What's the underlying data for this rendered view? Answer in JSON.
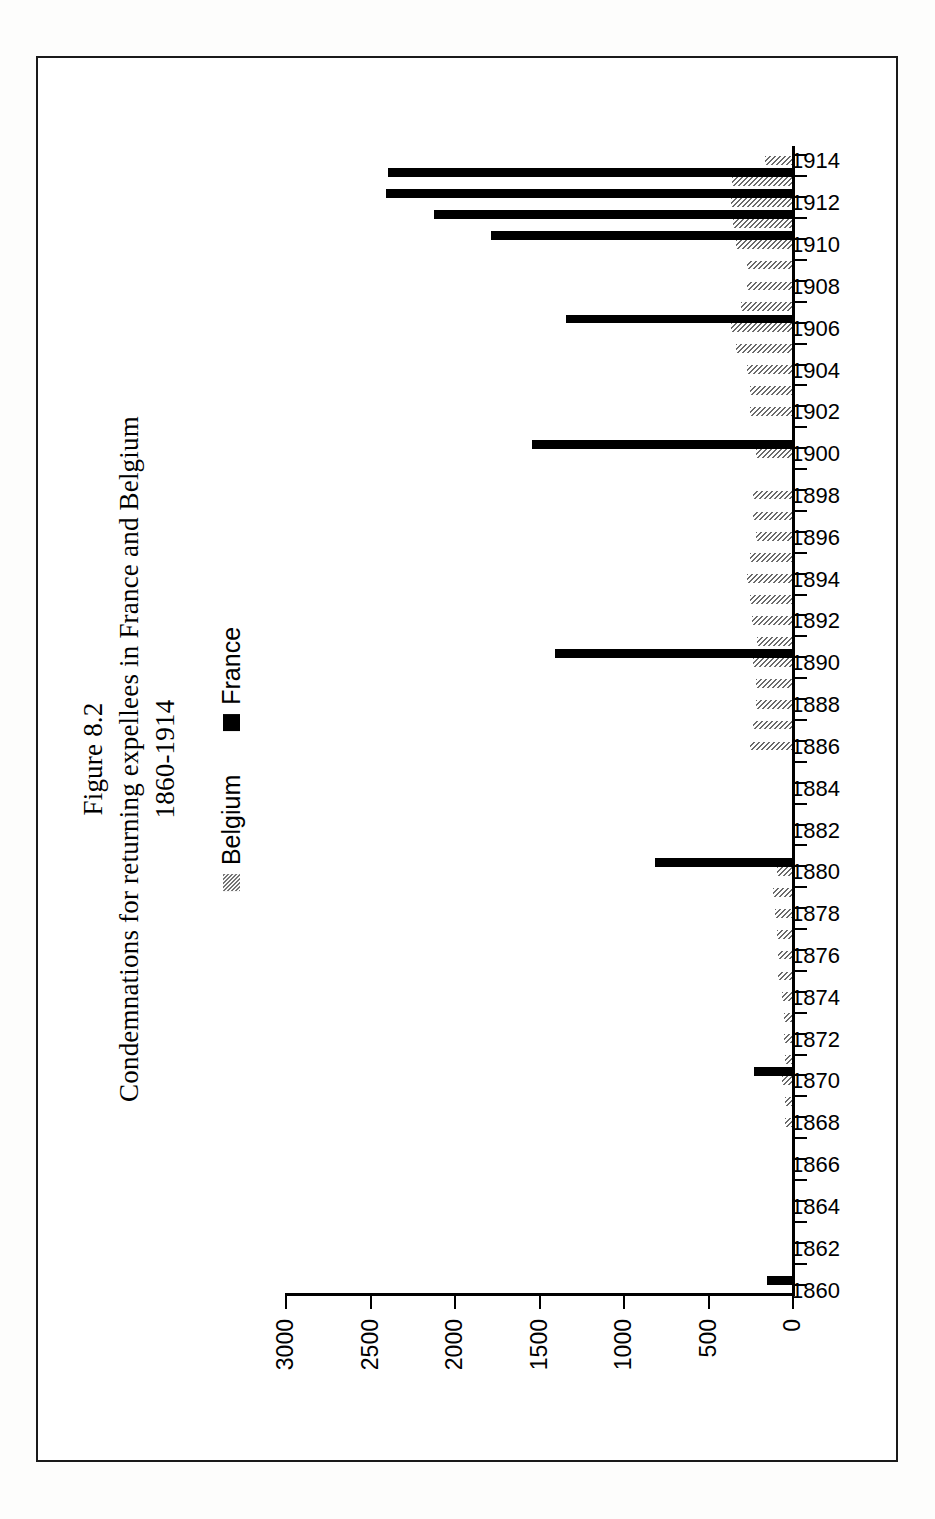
{
  "figure": {
    "label": "Figure 8.2",
    "title_line1": "Condemnations for returning expellees in France and Belgium",
    "title_line2": "1860-1914"
  },
  "legend": {
    "position": "top-center",
    "items": [
      {
        "label": "Belgium",
        "swatch": "gray-hatched",
        "color": "#6b6b6b"
      },
      {
        "label": "France",
        "swatch": "solid-black",
        "color": "#000000"
      }
    ]
  },
  "axis": {
    "value_ticks": [
      "3000",
      "2500",
      "2000",
      "1500",
      "1000",
      "500",
      "0"
    ],
    "value_label": "",
    "category_label": ""
  },
  "chart_data": {
    "type": "bar",
    "orientation": "horizontal-rotated",
    "xlabel": "Year",
    "ylabel": "Condemnations",
    "ylim": [
      0,
      3000
    ],
    "yticks": [
      0,
      500,
      1000,
      1500,
      2000,
      2500,
      3000
    ],
    "grid": false,
    "legend_position": "top-center",
    "categories": [
      "1860",
      "1861",
      "1862",
      "1863",
      "1864",
      "1865",
      "1866",
      "1867",
      "1868",
      "1869",
      "1870",
      "1871",
      "1872",
      "1873",
      "1874",
      "1875",
      "1876",
      "1877",
      "1878",
      "1879",
      "1880",
      "1881",
      "1882",
      "1883",
      "1884",
      "1885",
      "1886",
      "1887",
      "1888",
      "1889",
      "1890",
      "1891",
      "1892",
      "1893",
      "1894",
      "1895",
      "1896",
      "1897",
      "1898",
      "1899",
      "1900",
      "1901",
      "1902",
      "1903",
      "1904",
      "1905",
      "1906",
      "1907",
      "1908",
      "1909",
      "1910",
      "1911",
      "1912",
      "1913",
      "1914"
    ],
    "tick_categories": [
      "1860",
      "1862",
      "1864",
      "1866",
      "1868",
      "1870",
      "1872",
      "1874",
      "1876",
      "1878",
      "1880",
      "1882",
      "1884",
      "1886",
      "1888",
      "1890",
      "1892",
      "1894",
      "1896",
      "1898",
      "1900",
      "1902",
      "1904",
      "1906",
      "1908",
      "1910",
      "1912",
      "1914"
    ],
    "series": [
      {
        "name": "Belgium",
        "color": "#6b6b6b",
        "values": [
          0,
          0,
          0,
          0,
          0,
          0,
          0,
          0,
          40,
          40,
          60,
          40,
          50,
          50,
          60,
          80,
          80,
          90,
          100,
          110,
          90,
          0,
          0,
          0,
          0,
          0,
          250,
          230,
          215,
          215,
          230,
          205,
          235,
          250,
          265,
          250,
          215,
          230,
          230,
          0,
          215,
          0,
          250,
          250,
          265,
          330,
          360,
          300,
          265,
          265,
          330,
          350,
          360,
          355,
          160
        ]
      },
      {
        "name": "France",
        "color": "#000000",
        "values": [
          150,
          0,
          0,
          0,
          0,
          0,
          0,
          0,
          0,
          0,
          225,
          0,
          0,
          0,
          0,
          0,
          0,
          0,
          0,
          0,
          810,
          0,
          0,
          0,
          0,
          0,
          0,
          0,
          0,
          0,
          1400,
          0,
          0,
          0,
          0,
          0,
          0,
          0,
          0,
          0,
          1540,
          0,
          0,
          0,
          0,
          0,
          1340,
          0,
          0,
          0,
          1780,
          2120,
          2400,
          2390,
          0
        ]
      }
    ]
  }
}
